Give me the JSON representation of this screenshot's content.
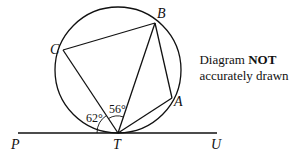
{
  "diagram": {
    "points": {
      "A": {
        "label": "A"
      },
      "B": {
        "label": "B"
      },
      "C": {
        "label": "C"
      },
      "T": {
        "label": "T"
      },
      "P": {
        "label": "P"
      },
      "U": {
        "label": "U"
      }
    },
    "angles": {
      "angle_PTC": "62°",
      "angle_CTB": "56°"
    },
    "note": {
      "prefix": "Diagram ",
      "emphasis": "NOT",
      "suffix": "accurately drawn"
    },
    "elements": [
      "circle through A, B, C, T",
      "tangent line PTU at T",
      "chords CB, BA, CT, BT, AT"
    ]
  }
}
